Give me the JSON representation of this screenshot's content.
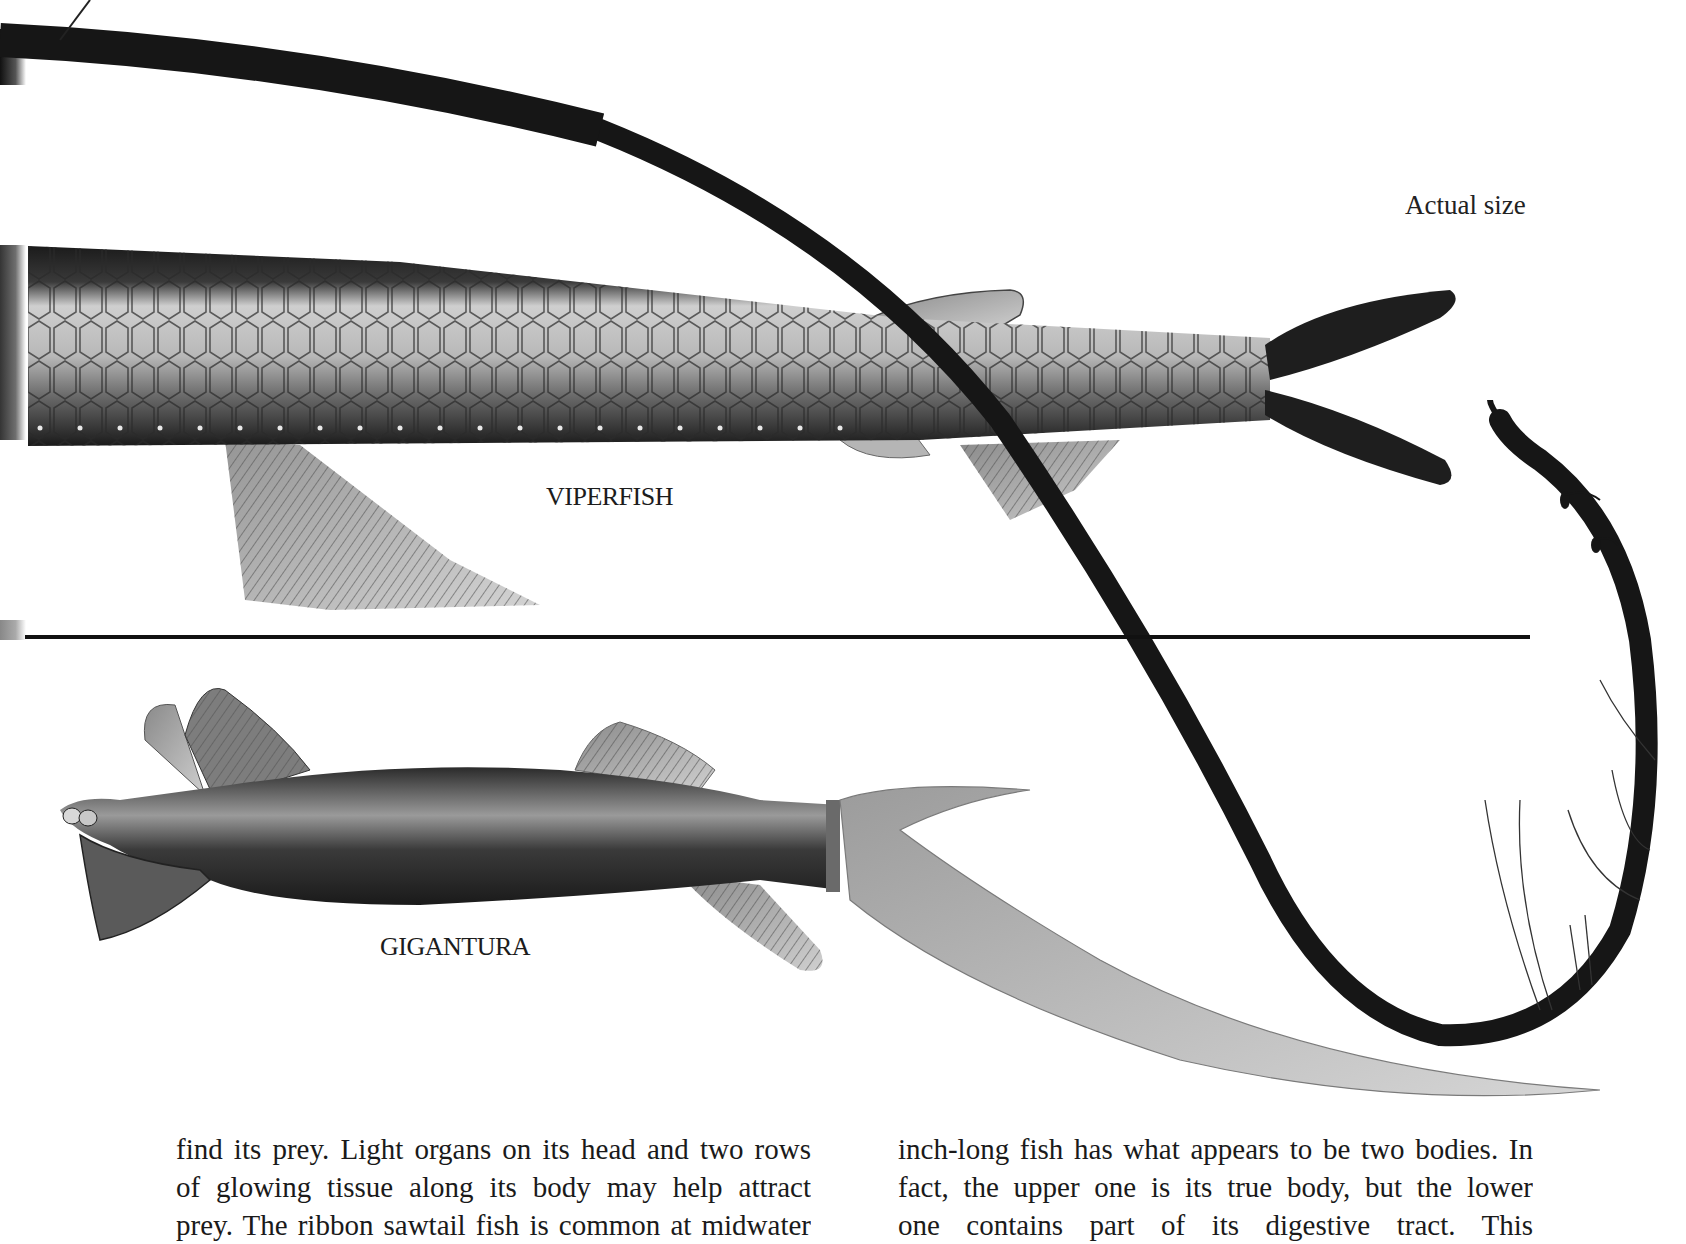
{
  "page": {
    "type": "scanned-book-page",
    "background": "#ffffff",
    "ink_color": "#1a1a1a"
  },
  "figure": {
    "scale_note": "Actual size",
    "divider_color": "#111111",
    "illustrations": [
      {
        "id": "viperfish",
        "label": "VIPERFISH"
      },
      {
        "id": "gigantura",
        "label": "GIGANTURA"
      },
      {
        "id": "ribbon-sawtail-fish",
        "label": ""
      }
    ]
  },
  "body_text": {
    "left_column": {
      "lines": [
        "find its prey. Light organs on its head and two rows",
        "of glowing tissue along its body may help attract",
        "prey. The ribbon sawtail fish is common at midwater"
      ]
    },
    "right_column": {
      "lines": [
        "inch-long fish has what appears to be two bodies. In",
        "fact, the upper one is its true body, but the lower",
        "one contains part of its digestive tract. This"
      ]
    }
  }
}
